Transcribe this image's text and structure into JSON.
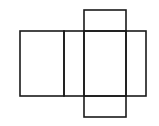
{
  "diagram": {
    "type": "net-of-rectangular-prism",
    "stroke_color": "#1a1a1a",
    "stroke_width": 1.6,
    "background": "#ffffff",
    "faces": [
      {
        "name": "face-left",
        "x": 20,
        "y": 31,
        "w": 44,
        "h": 65
      },
      {
        "name": "face-middle-left",
        "x": 64,
        "y": 31,
        "w": 20,
        "h": 65
      },
      {
        "name": "face-center",
        "x": 84,
        "y": 31,
        "w": 42,
        "h": 65
      },
      {
        "name": "face-right",
        "x": 126,
        "y": 31,
        "w": 20,
        "h": 65
      },
      {
        "name": "face-top",
        "x": 84,
        "y": 10,
        "w": 42,
        "h": 21
      },
      {
        "name": "face-bottom",
        "x": 84,
        "y": 96,
        "w": 42,
        "h": 21
      }
    ]
  }
}
